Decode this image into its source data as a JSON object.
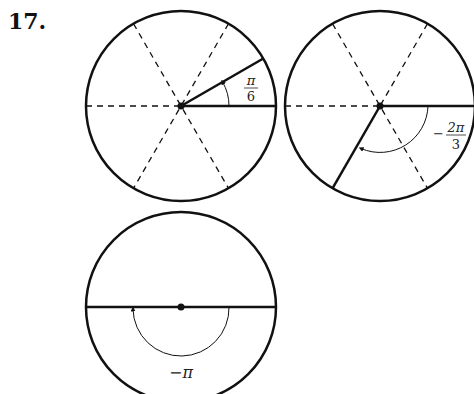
{
  "problem": {
    "number": "17."
  },
  "diagrams": [
    {
      "id": "circle-1",
      "angle_label_num": "π",
      "angle_label_den": "6",
      "angle": "π/6",
      "description": "Terminal side at 30° counterclockwise from positive x-axis"
    },
    {
      "id": "circle-2",
      "angle_label_sign": "−",
      "angle_label_num": "2π",
      "angle_label_den": "3",
      "angle": "−2π/3",
      "description": "Terminal side at 120° clockwise from positive x-axis"
    },
    {
      "id": "circle-3",
      "angle_label": "−π",
      "angle": "−π",
      "description": "Terminal side at 180° clockwise from positive x-axis"
    }
  ],
  "colors": {
    "stroke": "#111111",
    "background": "#ffffff"
  }
}
